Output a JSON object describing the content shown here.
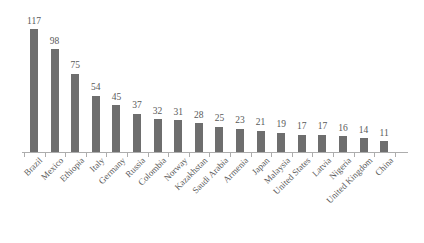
{
  "chart_data": {
    "type": "bar",
    "title": "",
    "subtitle": "",
    "xlabel": "",
    "ylabel": "",
    "ylim": [
      0,
      117
    ],
    "grid": false,
    "legend": false,
    "legend_position": "none",
    "orientation": "vertical",
    "bar_color": "#6e6e6e",
    "value_label_color": "#595959",
    "category_label_color": "#5a5a5a",
    "axis_color": "#adadad",
    "background_color": "#ffffff",
    "data_labels_shown": true,
    "axis_tick_labels_shown": false,
    "categories": [
      "Brazil",
      "Mexico",
      "Ethiopia",
      "Italy",
      "Germany",
      "Russia",
      "Colombia",
      "Norway",
      "Kazakhstan",
      "Saudi Arabia",
      "Armenia",
      "Japan",
      "Malaysia",
      "United States",
      "Latvia",
      "Nigeria",
      "United Kingdom",
      "China"
    ],
    "values": [
      117,
      98,
      75,
      54,
      45,
      37,
      32,
      31,
      28,
      25,
      23,
      21,
      19,
      17,
      17,
      16,
      14,
      11
    ]
  }
}
